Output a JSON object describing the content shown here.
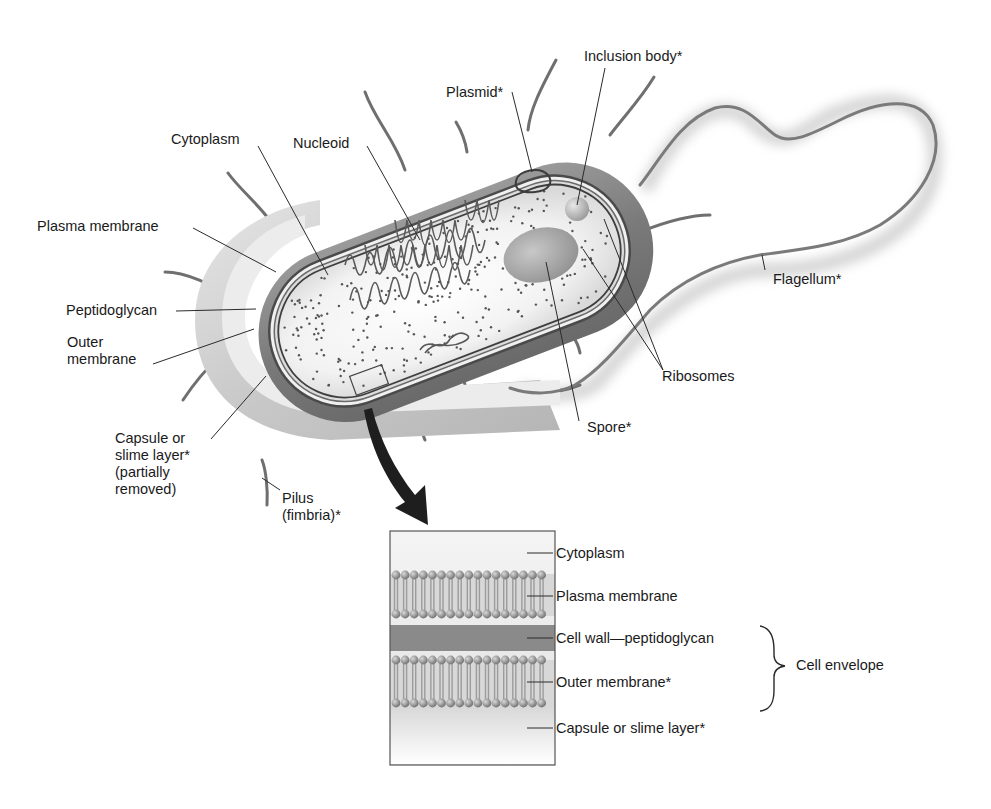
{
  "diagram": {
    "cell_labels": {
      "cytoplasm": "Cytoplasm",
      "nucleoid": "Nucleoid",
      "plasmid": "Plasmid*",
      "inclusion_body": "Inclusion body*",
      "plasma_membrane": "Plasma membrane",
      "peptidoglycan": "Peptidoglycan",
      "outer_membrane": "Outer\nmembrane",
      "capsule": "Capsule or\nslime layer*\n(partially\nremoved)",
      "pilus": "Pilus\n(fimbria)*",
      "flagellum": "Flagellum*",
      "ribosomes": "Ribosomes",
      "spore": "Spore*"
    },
    "inset": {
      "layers": [
        {
          "label": "Cytoplasm"
        },
        {
          "label": "Plasma membrane"
        },
        {
          "label": "Cell wall—peptidoglycan"
        },
        {
          "label": "Outer membrane*"
        },
        {
          "label": "Capsule or slime layer*"
        }
      ],
      "bracket_label": "Cell envelope"
    },
    "colors": {
      "cell_body": "#7d7d7d",
      "capsule": "#cfcfcf",
      "cytoplasm": "#f4f4f4",
      "membrane": "#555555",
      "text": "#1a1a1a"
    }
  }
}
